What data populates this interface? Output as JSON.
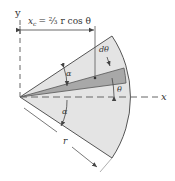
{
  "figure": {
    "labels": {
      "y_axis": "y",
      "x_axis": "x",
      "formula_lhs": "x",
      "formula_sub": "c",
      "formula_rhs": "= ⅔ r cos θ",
      "d_theta": "dθ",
      "theta": "θ",
      "alpha_upper": "α",
      "alpha_lower": "α",
      "radius": "r"
    },
    "colors": {
      "sector_fill": "#e4e4e4",
      "element_fill": "#a8a8a8",
      "stroke": "#555555",
      "axis": "#666666"
    }
  }
}
